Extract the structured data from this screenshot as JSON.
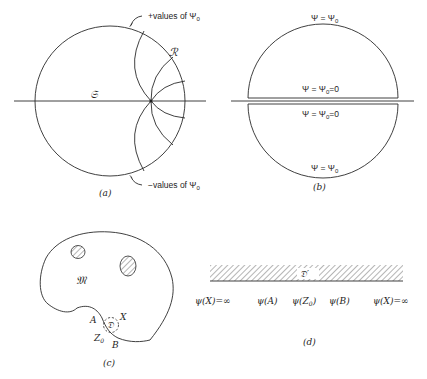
{
  "figure": {
    "panels": [
      {
        "id": "a",
        "caption": "(a)",
        "labels": {
          "top": "+values of Ψ",
          "top_sub": "0",
          "bottom": "−values of Ψ",
          "bottom_sub": "0",
          "region_R": "ℛ",
          "line_S": "𝔖"
        }
      },
      {
        "id": "b",
        "caption": "(b)",
        "labels": {
          "top": "Ψ = Ψ",
          "top_sub": "0",
          "mid_upper": "Ψ = Ψ",
          "mid_upper_sub": "0",
          "mid_upper_tail": "=0",
          "mid_lower": "Ψ = Ψ",
          "mid_lower_sub": "0",
          "mid_lower_tail": "=0",
          "bottom": "Ψ = Ψ",
          "bottom_sub": "0"
        }
      },
      {
        "id": "c",
        "caption": "(c)",
        "labels": {
          "region_M": "𝔐",
          "region_D": "𝔇",
          "point_A": "A",
          "point_X": "X",
          "point_Z": "Z",
          "point_Z_sub": "0",
          "point_B": "B"
        }
      },
      {
        "id": "d",
        "caption": "(d)",
        "labels": {
          "region_D_prime": "𝔇′",
          "left_inf": "ψ(X)=∞",
          "psi_A": "ψ(A)",
          "psi_Z0": "ψ(Z",
          "psi_Z0_sub": "0",
          "psi_Z0_tail": ")",
          "psi_B": "ψ(B)",
          "right_inf": "ψ(X)=∞"
        }
      }
    ]
  }
}
